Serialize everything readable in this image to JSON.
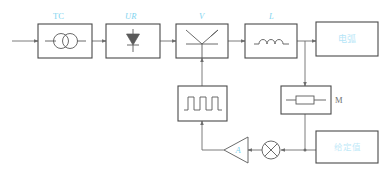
{
  "diagram": {
    "kind": "thyristor-rectifier-closed-loop-control-block-diagram",
    "blocks": {
      "transformer": {
        "label": "TC",
        "symbol_name": "transformer-two-circles"
      },
      "rectifier": {
        "label": "UR",
        "symbol_name": "diode-rectifier"
      },
      "thyristor": {
        "label": "V",
        "symbol_name": "thyristor-scr"
      },
      "inductor": {
        "label": "L",
        "symbol_name": "inductor-coil"
      },
      "load": {
        "label": "电弧",
        "symbol_name": "load-block"
      },
      "pulse_generator": {
        "label": "",
        "symbol_name": "square-wave-pulse"
      },
      "shunt": {
        "label": "M",
        "symbol_name": "resistor-shunt"
      },
      "setpoint": {
        "label": "给定值",
        "symbol_name": "setpoint-block"
      },
      "amplifier": {
        "label": "A",
        "symbol_name": "amplifier-triangle"
      },
      "summing_junction": {
        "label": "",
        "symbol_name": "summing-junction-cross-circle"
      }
    },
    "colors": {
      "label_accent": "#7fd4ef",
      "cjk_accent": "#b6e6f7",
      "box_stroke": "#4a4a4a",
      "wire": "#6d6d6d",
      "symbol": "#5a5a5a",
      "background": "#ffffff"
    }
  }
}
